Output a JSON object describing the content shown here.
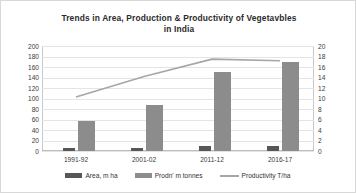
{
  "chart_data": {
    "type": "bar",
    "title": "Trends in Area, Production & Productivity of Vegetavbles in India",
    "title_line1": "Trends in Area, Production & Productivity of Vegetavbles",
    "title_line2": "in India",
    "categories": [
      "1991-92",
      "2001-02",
      "2011-12",
      "2016-17"
    ],
    "series": [
      {
        "name": "Area, m ha",
        "type": "bar",
        "axis": "left",
        "color": "#575757",
        "values": [
          5.6,
          6.2,
          9.2,
          10.3
        ]
      },
      {
        "name": "Prodn' m tonnes",
        "type": "bar",
        "axis": "left",
        "color": "#8c8c8c",
        "values": [
          58,
          88,
          150,
          169
        ]
      },
      {
        "name": "Productivity T/ha",
        "type": "line",
        "axis": "right",
        "color": "#a6a6a6",
        "values": [
          10.3,
          14.2,
          17.5,
          17.2
        ]
      }
    ],
    "xlabel": "",
    "ylabel": "",
    "ylim": [
      0,
      200
    ],
    "y2lim": [
      0,
      20
    ],
    "yticks": [
      200,
      180,
      160,
      140,
      120,
      100,
      80,
      60,
      40,
      20,
      0
    ],
    "y2ticks": [
      20,
      18,
      16,
      14,
      12,
      10,
      8,
      6,
      4,
      2,
      0
    ],
    "grid": true,
    "legend_position": "bottom",
    "legend": [
      "Area, m ha",
      "Prodn' m tonnes",
      "Productivity T/ha"
    ]
  }
}
